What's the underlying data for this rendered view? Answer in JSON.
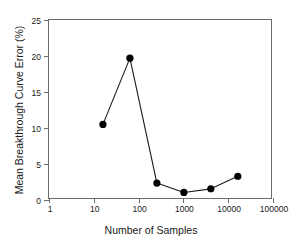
{
  "chart_data": {
    "type": "line",
    "title": "",
    "xlabel": "Number of Samples",
    "ylabel": "Mean Breakthrough Curve Error (%)",
    "xscale": "log",
    "yscale": "linear",
    "xlim": [
      1,
      100000
    ],
    "ylim": [
      0,
      25
    ],
    "grid": false,
    "legend": null,
    "xticks": [
      {
        "value": 1,
        "label": "1"
      },
      {
        "value": 10,
        "label": "10"
      },
      {
        "value": 100,
        "label": "100"
      },
      {
        "value": 1000,
        "label": "1000"
      },
      {
        "value": 10000,
        "label": "10000"
      },
      {
        "value": 100000,
        "label": "100000"
      }
    ],
    "yticks": [
      {
        "value": 0,
        "label": "0"
      },
      {
        "value": 5,
        "label": "5"
      },
      {
        "value": 10,
        "label": "10"
      },
      {
        "value": 15,
        "label": "15"
      },
      {
        "value": 20,
        "label": "20"
      },
      {
        "value": 25,
        "label": "25"
      }
    ],
    "series": [
      {
        "name": "Mean Breakthrough Curve Error",
        "marker": "filled-circle",
        "marker_color": "#000000",
        "line_color": "#1a1a1a",
        "x": [
          16,
          64,
          256,
          1024,
          4096,
          16384
        ],
        "y": [
          10.5,
          19.7,
          2.35,
          1.05,
          1.55,
          3.3
        ]
      }
    ]
  },
  "colors": {
    "axis": "#6b6b6b",
    "text": "#1a1a1a",
    "marker": "#000000",
    "line": "#1a1a1a",
    "background": "#ffffff"
  }
}
